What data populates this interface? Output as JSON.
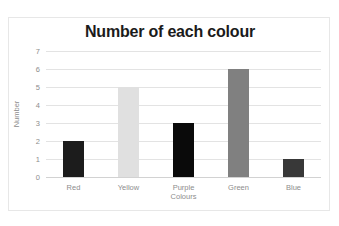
{
  "top_strip_text": "",
  "chart_data": {
    "type": "bar",
    "title": "Number of each colour",
    "xlabel": "Colours",
    "ylabel": "Number",
    "categories": [
      "Red",
      "Yellow",
      "Purple",
      "Green",
      "Blue"
    ],
    "values": [
      2,
      5,
      3,
      6,
      1
    ],
    "bar_colors": [
      "#1c1c1c",
      "#e0e0e0",
      "#0a0a0a",
      "#808080",
      "#383838"
    ],
    "ylim": [
      0,
      7
    ],
    "ytick_labels": [
      "0",
      "1",
      "2",
      "3",
      "4",
      "5",
      "6",
      "7"
    ],
    "ytick_values": [
      0,
      1,
      2,
      3,
      4,
      5,
      6,
      7
    ],
    "grid": true,
    "legend": false,
    "legend_position": "none",
    "gridline_color": "#e3e3e3",
    "axis_text_color": "#8d8d8d",
    "title_color": "#1b1b1b",
    "plot_background": "#ffffff",
    "frame_border_color": "#e7e7e7"
  }
}
